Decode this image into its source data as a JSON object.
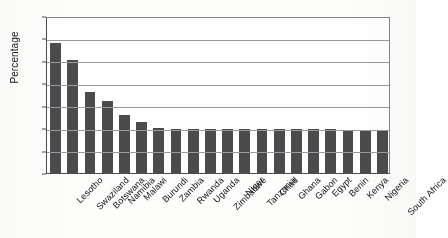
{
  "chart_data": {
    "type": "bar",
    "title": "",
    "xlabel": "",
    "ylabel": "Percentage",
    "ylim": [
      0,
      35
    ],
    "yticks": [
      0,
      5,
      10,
      15,
      20,
      25,
      30,
      35
    ],
    "grid": true,
    "legend": false,
    "orientation": "vertical",
    "bar_color": "#4b4b4d",
    "categories": [
      "Lesotho",
      "Swaziland",
      "Botswana",
      "Namibia",
      "Malawi",
      "Burundi",
      "Zambia",
      "Rwanda",
      "Uganda",
      "Zimbabwe",
      "Niger",
      "Tanzania",
      "Chad",
      "Ghana",
      "Gabon",
      "Egypt",
      "Benin",
      "Kenya",
      "Nigeria",
      "South Africa"
    ],
    "values": [
      29.0,
      25.3,
      18.1,
      16.1,
      12.9,
      11.4,
      10.1,
      9.8,
      9.8,
      9.8,
      9.8,
      9.8,
      9.8,
      9.8,
      9.8,
      9.8,
      9.8,
      9.3,
      9.3,
      9.3
    ]
  }
}
